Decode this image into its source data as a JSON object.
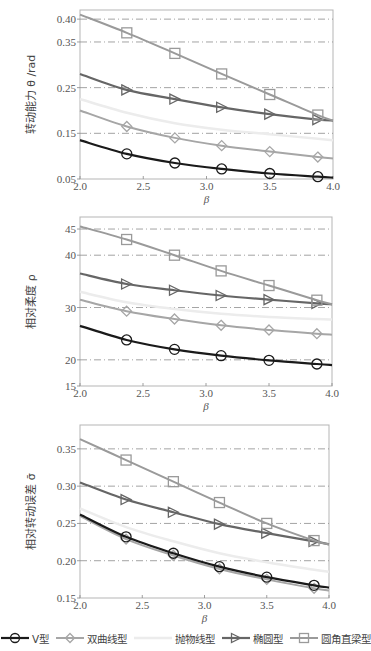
{
  "legend": [
    {
      "key": "v",
      "label": "V型",
      "color": "#1a1a1a",
      "marker": "circle",
      "width": 2.2
    },
    {
      "key": "hyperbolic",
      "label": "双曲线型",
      "color": "#a6a6a6",
      "marker": "diamond",
      "width": 2.0
    },
    {
      "key": "parabolic",
      "label": "抛物线型",
      "color": "#ececec",
      "marker": "none",
      "width": 2.5
    },
    {
      "key": "elliptic",
      "label": "椭圆型",
      "color": "#666666",
      "marker": "triangle-right",
      "width": 2.2
    },
    {
      "key": "rounded",
      "label": "圆角直梁型",
      "color": "#9a9a9a",
      "marker": "square",
      "width": 2.0
    }
  ],
  "chart_data": [
    {
      "type": "line",
      "title": "",
      "xlabel": "β",
      "ylabel": "转动能力 θ /rad",
      "xlim": [
        2.0,
        4.0
      ],
      "ylim": [
        0.05,
        0.42
      ],
      "xticks": [
        "2.0",
        "2.5",
        "3.0",
        "3.5",
        "4.0"
      ],
      "yticks": [
        "0.05",
        "0.15",
        "0.25",
        "0.35",
        "0.40"
      ],
      "ytick_values": [
        0.05,
        0.15,
        0.25,
        0.35,
        0.4
      ],
      "grid": "dash-dot horizontal",
      "x": [
        2.0,
        2.37,
        2.75,
        3.12,
        3.5,
        3.88,
        4.0
      ],
      "series": [
        {
          "name": "V型",
          "key": "v",
          "values": [
            0.135,
            0.105,
            0.085,
            0.072,
            0.062,
            0.055,
            0.053
          ]
        },
        {
          "name": "双曲线型",
          "key": "hyperbolic",
          "values": [
            0.2,
            0.165,
            0.14,
            0.123,
            0.11,
            0.098,
            0.095
          ]
        },
        {
          "name": "抛物线型",
          "key": "parabolic",
          "values": [
            0.225,
            0.195,
            0.172,
            0.158,
            0.148,
            0.138,
            0.135
          ]
        },
        {
          "name": "椭圆型",
          "key": "elliptic",
          "values": [
            0.28,
            0.245,
            0.225,
            0.207,
            0.192,
            0.18,
            0.178
          ]
        },
        {
          "name": "圆角直梁型",
          "key": "rounded",
          "values": [
            0.41,
            0.37,
            0.325,
            0.28,
            0.235,
            0.19,
            0.178
          ]
        }
      ]
    },
    {
      "type": "line",
      "title": "",
      "xlabel": "β",
      "ylabel": "相对柔度 ρ",
      "xlim": [
        2.0,
        4.0
      ],
      "ylim": [
        15,
        47.3
      ],
      "xticks": [
        "2.0",
        "2.5",
        "3.0",
        "3.5",
        "4.0"
      ],
      "yticks": [
        "15",
        "20",
        "30",
        "40",
        "45"
      ],
      "ytick_values": [
        15,
        20,
        30,
        40,
        45
      ],
      "grid": "dash-dot horizontal",
      "x": [
        2.0,
        2.37,
        2.75,
        3.12,
        3.5,
        3.88,
        4.0
      ],
      "series": [
        {
          "name": "V型",
          "key": "v",
          "values": [
            26.5,
            23.8,
            22.0,
            20.8,
            19.9,
            19.2,
            19.0
          ]
        },
        {
          "name": "双曲线型",
          "key": "hyperbolic",
          "values": [
            31.5,
            29.3,
            27.8,
            26.6,
            25.7,
            25.0,
            24.8
          ]
        },
        {
          "name": "抛物线型",
          "key": "parabolic",
          "values": [
            33.0,
            31.0,
            29.7,
            28.8,
            28.2,
            27.8,
            27.7
          ]
        },
        {
          "name": "椭圆型",
          "key": "elliptic",
          "values": [
            36.5,
            34.5,
            33.3,
            32.3,
            31.5,
            30.8,
            30.6
          ]
        },
        {
          "name": "圆角直梁型",
          "key": "rounded",
          "values": [
            45.5,
            43.0,
            40.0,
            37.0,
            34.2,
            31.4,
            30.6
          ]
        }
      ]
    },
    {
      "type": "line",
      "title": "",
      "xlabel": "β",
      "ylabel": "相对转动误差 σ̄",
      "xlim": [
        2.0,
        4.0
      ],
      "ylim": [
        0.15,
        0.382
      ],
      "xticks": [
        "2.0",
        "2.5",
        "3.0",
        "3.5",
        "4.0"
      ],
      "yticks": [
        "0.15",
        "0.20",
        "0.25",
        "0.30",
        "0.35"
      ],
      "ytick_values": [
        0.15,
        0.2,
        0.25,
        0.3,
        0.35
      ],
      "grid": "dash-dot horizontal",
      "x": [
        2.0,
        2.37,
        2.75,
        3.12,
        3.5,
        3.88,
        4.0
      ],
      "series": [
        {
          "name": "V型",
          "key": "v",
          "values": [
            0.262,
            0.232,
            0.21,
            0.192,
            0.178,
            0.167,
            0.164
          ]
        },
        {
          "name": "双曲线型",
          "key": "hyperbolic",
          "values": [
            0.26,
            0.229,
            0.207,
            0.189,
            0.175,
            0.163,
            0.16
          ]
        },
        {
          "name": "抛物线型",
          "key": "parabolic",
          "values": [
            0.27,
            0.245,
            0.226,
            0.21,
            0.198,
            0.188,
            0.185
          ]
        },
        {
          "name": "椭圆型",
          "key": "elliptic",
          "values": [
            0.305,
            0.282,
            0.265,
            0.249,
            0.237,
            0.226,
            0.222
          ]
        },
        {
          "name": "圆角直梁型",
          "key": "rounded",
          "values": [
            0.363,
            0.335,
            0.306,
            0.278,
            0.25,
            0.227,
            0.222
          ]
        }
      ]
    }
  ],
  "layout": {
    "panels": [
      {
        "left": 80,
        "right": 333,
        "top": 10,
        "bottom": 179
      },
      {
        "left": 80,
        "right": 332,
        "top": 217,
        "bottom": 386
      },
      {
        "left": 80,
        "right": 329,
        "top": 425,
        "bottom": 598
      }
    ]
  }
}
